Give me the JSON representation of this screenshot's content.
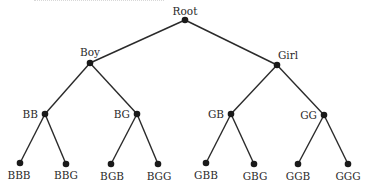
{
  "diagram": {
    "type": "tree",
    "colors": {
      "line": "#2a2a2a",
      "node": "#1a1a1a",
      "text": "#2a2a2a",
      "background": "#ffffff"
    },
    "nodes": [
      {
        "id": "root",
        "label": "Root",
        "x": 185,
        "y": 20,
        "lx": 185,
        "ly": 15,
        "anchor": "middle"
      },
      {
        "id": "boy",
        "label": "Boy",
        "x": 90,
        "y": 63,
        "lx": 90,
        "ly": 56,
        "anchor": "middle"
      },
      {
        "id": "girl",
        "label": "Girl",
        "x": 277,
        "y": 65,
        "lx": 288,
        "ly": 59,
        "anchor": "middle"
      },
      {
        "id": "bb",
        "label": "BB",
        "x": 45,
        "y": 114,
        "lx": 38,
        "ly": 118,
        "anchor": "end"
      },
      {
        "id": "bg",
        "label": "BG",
        "x": 137,
        "y": 114,
        "lx": 130,
        "ly": 118,
        "anchor": "end"
      },
      {
        "id": "gb",
        "label": "GB",
        "x": 231,
        "y": 114,
        "lx": 224,
        "ly": 118,
        "anchor": "end"
      },
      {
        "id": "gg",
        "label": "GG",
        "x": 324,
        "y": 115,
        "lx": 317,
        "ly": 119,
        "anchor": "end"
      },
      {
        "id": "bbb",
        "label": "BBB",
        "x": 20,
        "y": 163,
        "lx": 19,
        "ly": 179,
        "anchor": "middle"
      },
      {
        "id": "bbg",
        "label": "BBG",
        "x": 66,
        "y": 164,
        "lx": 66,
        "ly": 179,
        "anchor": "middle"
      },
      {
        "id": "bgb",
        "label": "BGB",
        "x": 111,
        "y": 164,
        "lx": 112,
        "ly": 180,
        "anchor": "middle"
      },
      {
        "id": "bgg",
        "label": "BGG",
        "x": 158,
        "y": 164,
        "lx": 159,
        "ly": 180,
        "anchor": "middle"
      },
      {
        "id": "gbb",
        "label": "GBB",
        "x": 206,
        "y": 163,
        "lx": 206,
        "ly": 179,
        "anchor": "middle"
      },
      {
        "id": "gbg",
        "label": "GBG",
        "x": 254,
        "y": 164,
        "lx": 255,
        "ly": 180,
        "anchor": "middle"
      },
      {
        "id": "ggb",
        "label": "GGB",
        "x": 298,
        "y": 164,
        "lx": 298,
        "ly": 180,
        "anchor": "middle"
      },
      {
        "id": "ggg",
        "label": "GGG",
        "x": 348,
        "y": 164,
        "lx": 348,
        "ly": 180,
        "anchor": "middle"
      }
    ],
    "edges": [
      [
        "root",
        "boy"
      ],
      [
        "root",
        "girl"
      ],
      [
        "boy",
        "bb"
      ],
      [
        "boy",
        "bg"
      ],
      [
        "girl",
        "gb"
      ],
      [
        "girl",
        "gg"
      ],
      [
        "bb",
        "bbb"
      ],
      [
        "bb",
        "bbg"
      ],
      [
        "bg",
        "bgb"
      ],
      [
        "bg",
        "bgg"
      ],
      [
        "gb",
        "gbb"
      ],
      [
        "gb",
        "gbg"
      ],
      [
        "gg",
        "ggb"
      ],
      [
        "gg",
        "ggg"
      ]
    ]
  }
}
